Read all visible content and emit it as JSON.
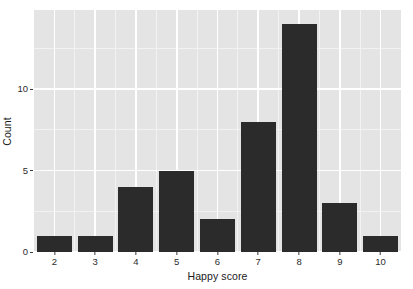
{
  "chart_data": {
    "type": "bar",
    "title": "",
    "subtitle": "",
    "xlabel": "Happy score",
    "ylabel": "Count",
    "categories": [
      "2",
      "3",
      "4",
      "5",
      "6",
      "7",
      "8",
      "9",
      "10"
    ],
    "values": [
      1,
      1,
      4,
      5,
      2,
      8,
      14,
      3,
      1
    ],
    "series": [
      {
        "name": "Count",
        "values": [
          1,
          1,
          4,
          5,
          2,
          8,
          14,
          3,
          1
        ]
      }
    ],
    "xlim": [
      1.5,
      10.5
    ],
    "ylim": [
      0,
      14.85
    ],
    "x_tick_labels": [
      "2",
      "3",
      "4",
      "5",
      "6",
      "7",
      "8",
      "9",
      "10"
    ],
    "x_tick_values": [
      2,
      3,
      4,
      5,
      6,
      7,
      8,
      9,
      10
    ],
    "y_tick_labels": [
      "0",
      "5",
      "10"
    ],
    "y_tick_values": [
      0,
      5,
      10
    ],
    "y_minor_tick_values": [
      2.5,
      7.5,
      12.5
    ],
    "x_minor_tick_values": [
      2.5,
      3.5,
      4.5,
      5.5,
      6.5,
      7.5,
      8.5,
      9.5
    ],
    "grid": true,
    "legend": null,
    "legend_position": "none",
    "annotations": [],
    "bar_color": "#2b2b2b",
    "panel_background": "#e4e4e4",
    "grid_major_color": "#ffffff",
    "grid_minor_color": "#f2f2f2",
    "axis_text_color": "#2b2b2b",
    "axis_title_color": "#1a1a1a",
    "bar_relative_width": 0.86
  }
}
